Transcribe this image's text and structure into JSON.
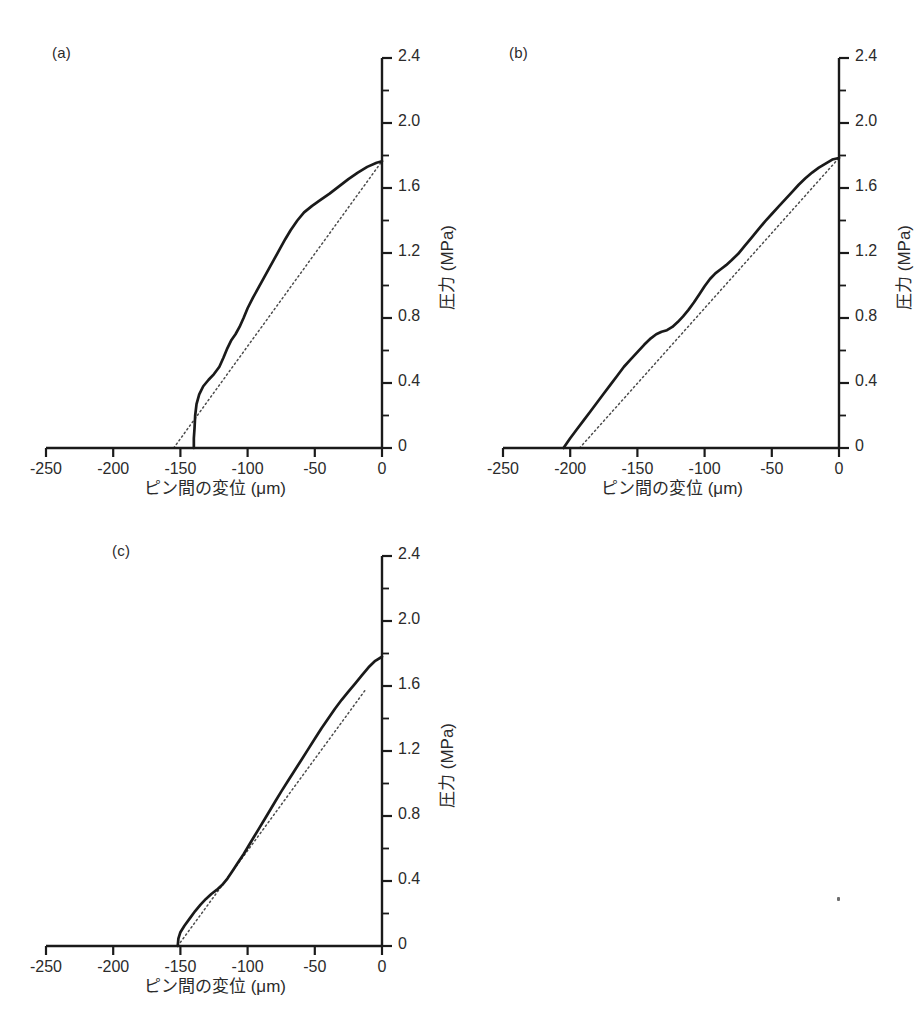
{
  "figure": {
    "background": "#ffffff",
    "ink_color": "#1a1a1a",
    "panels": [
      {
        "label": "(a)",
        "xlabel": "ピン間の変位 (μm)",
        "ylabel": "圧力 (MPa)"
      },
      {
        "label": "(b)",
        "xlabel": "ピン間の変位 (μm)",
        "ylabel": "圧力 (MPa)"
      },
      {
        "label": "(c)",
        "xlabel": "ピン間の変位 (μm)",
        "ylabel": "圧力 (MPa)"
      }
    ]
  },
  "chart_data": [
    {
      "type": "line",
      "panel": "(a)",
      "title": "",
      "xlabel": "ピン間の変位 (μm)",
      "ylabel": "圧力 (MPa)",
      "xlim": [
        -250,
        0
      ],
      "ylim": [
        0,
        2.4
      ],
      "xticks": [
        -250,
        -200,
        -150,
        -100,
        -50,
        0
      ],
      "xtick_labels": [
        "-250",
        "-200",
        "-150",
        "-100",
        "-50",
        "0"
      ],
      "yticks": [
        0,
        0.4,
        0.8,
        1.2,
        1.6,
        2.0,
        2.4
      ],
      "ytick_labels": [
        "0",
        "0.4",
        "0.8",
        "1.2",
        "1.6",
        "2.0",
        "2.4"
      ],
      "minor_yticks": [
        0.2,
        0.6,
        1.0,
        1.4,
        1.8,
        2.2
      ],
      "grid": false,
      "legend": "none",
      "series": [
        {
          "name": "measured",
          "style": "solid",
          "points": [
            [
              -140,
              0.0
            ],
            [
              -140,
              0.06
            ],
            [
              -139.5,
              0.12
            ],
            [
              -139,
              0.2
            ],
            [
              -138,
              0.27
            ],
            [
              -136,
              0.33
            ],
            [
              -133,
              0.38
            ],
            [
              -129,
              0.42
            ],
            [
              -125,
              0.455
            ],
            [
              -121,
              0.5
            ],
            [
              -118,
              0.555
            ],
            [
              -115,
              0.615
            ],
            [
              -112,
              0.665
            ],
            [
              -109,
              0.7
            ],
            [
              -106,
              0.745
            ],
            [
              -103,
              0.8
            ],
            [
              -100,
              0.86
            ],
            [
              -96,
              0.925
            ],
            [
              -92,
              0.985
            ],
            [
              -88,
              1.045
            ],
            [
              -84,
              1.105
            ],
            [
              -80,
              1.165
            ],
            [
              -76,
              1.225
            ],
            [
              -72,
              1.285
            ],
            [
              -68,
              1.34
            ],
            [
              -63,
              1.4
            ],
            [
              -58,
              1.45
            ],
            [
              -52,
              1.49
            ],
            [
              -46,
              1.525
            ],
            [
              -39,
              1.565
            ],
            [
              -32,
              1.61
            ],
            [
              -25,
              1.655
            ],
            [
              -18,
              1.695
            ],
            [
              -11,
              1.73
            ],
            [
              -4,
              1.755
            ],
            [
              0,
              1.765
            ]
          ]
        },
        {
          "name": "linear-fit",
          "style": "dotted",
          "points": [
            [
              -155,
              0.0
            ],
            [
              0,
              1.765
            ]
          ]
        }
      ]
    },
    {
      "type": "line",
      "panel": "(b)",
      "title": "",
      "xlabel": "ピン間の変位 (μm)",
      "ylabel": "圧力 (MPa)",
      "xlim": [
        -250,
        0
      ],
      "ylim": [
        0,
        2.4
      ],
      "xticks": [
        -250,
        -200,
        -150,
        -100,
        -50,
        0
      ],
      "xtick_labels": [
        "-250",
        "-200",
        "-150",
        "-100",
        "-50",
        "0"
      ],
      "yticks": [
        0,
        0.4,
        0.8,
        1.2,
        1.6,
        2.0,
        2.4
      ],
      "ytick_labels": [
        "0",
        "0.4",
        "0.8",
        "1.2",
        "1.6",
        "2.0",
        "2.4"
      ],
      "minor_yticks": [
        0.2,
        0.6,
        1.0,
        1.4,
        1.8,
        2.2
      ],
      "grid": false,
      "legend": "none",
      "series": [
        {
          "name": "measured",
          "style": "solid",
          "points": [
            [
              -205,
              0.0
            ],
            [
              -200,
              0.06
            ],
            [
              -195,
              0.115
            ],
            [
              -190,
              0.17
            ],
            [
              -185,
              0.225
            ],
            [
              -180,
              0.28
            ],
            [
              -175,
              0.335
            ],
            [
              -170,
              0.39
            ],
            [
              -165,
              0.445
            ],
            [
              -160,
              0.5
            ],
            [
              -155,
              0.545
            ],
            [
              -150,
              0.59
            ],
            [
              -145,
              0.635
            ],
            [
              -140,
              0.675
            ],
            [
              -136,
              0.7
            ],
            [
              -132,
              0.715
            ],
            [
              -128,
              0.725
            ],
            [
              -124,
              0.745
            ],
            [
              -120,
              0.775
            ],
            [
              -116,
              0.81
            ],
            [
              -112,
              0.85
            ],
            [
              -108,
              0.895
            ],
            [
              -104,
              0.945
            ],
            [
              -100,
              0.995
            ],
            [
              -96,
              1.04
            ],
            [
              -92,
              1.075
            ],
            [
              -88,
              1.1
            ],
            [
              -84,
              1.125
            ],
            [
              -80,
              1.155
            ],
            [
              -75,
              1.195
            ],
            [
              -70,
              1.245
            ],
            [
              -65,
              1.295
            ],
            [
              -60,
              1.345
            ],
            [
              -55,
              1.395
            ],
            [
              -50,
              1.44
            ],
            [
              -45,
              1.485
            ],
            [
              -40,
              1.53
            ],
            [
              -35,
              1.575
            ],
            [
              -30,
              1.62
            ],
            [
              -25,
              1.66
            ],
            [
              -20,
              1.695
            ],
            [
              -15,
              1.725
            ],
            [
              -10,
              1.75
            ],
            [
              -5,
              1.775
            ],
            [
              0,
              1.785
            ]
          ]
        },
        {
          "name": "linear-fit",
          "style": "dotted",
          "points": [
            [
              -193,
              0.0
            ],
            [
              0,
              1.785
            ]
          ]
        }
      ]
    },
    {
      "type": "line",
      "panel": "(c)",
      "title": "",
      "xlabel": "ピン間の変位 (μm)",
      "ylabel": "圧力 (MPa)",
      "xlim": [
        -250,
        0
      ],
      "ylim": [
        0,
        2.4
      ],
      "xticks": [
        -250,
        -200,
        -150,
        -100,
        -50,
        0
      ],
      "xtick_labels": [
        "-250",
        "-200",
        "-150",
        "-100",
        "-50",
        "0"
      ],
      "yticks": [
        0,
        0.4,
        0.8,
        1.2,
        1.6,
        2.0,
        2.4
      ],
      "ytick_labels": [
        "0",
        "0.4",
        "0.8",
        "1.2",
        "1.6",
        "2.0",
        "2.4"
      ],
      "minor_yticks": [
        0.2,
        0.6,
        1.0,
        1.4,
        1.8,
        2.2
      ],
      "grid": false,
      "legend": "none",
      "series": [
        {
          "name": "measured",
          "style": "solid",
          "points": [
            [
              -152,
              0.0
            ],
            [
              -151.5,
              0.045
            ],
            [
              -150,
              0.085
            ],
            [
              -147,
              0.125
            ],
            [
              -143,
              0.17
            ],
            [
              -139,
              0.215
            ],
            [
              -135,
              0.255
            ],
            [
              -131,
              0.29
            ],
            [
              -127,
              0.32
            ],
            [
              -123,
              0.345
            ],
            [
              -119,
              0.375
            ],
            [
              -115,
              0.415
            ],
            [
              -111,
              0.465
            ],
            [
              -107,
              0.515
            ],
            [
              -103,
              0.565
            ],
            [
              -99,
              0.62
            ],
            [
              -95,
              0.675
            ],
            [
              -91,
              0.73
            ],
            [
              -87,
              0.785
            ],
            [
              -83,
              0.84
            ],
            [
              -79,
              0.895
            ],
            [
              -75,
              0.95
            ],
            [
              -70,
              1.015
            ],
            [
              -65,
              1.08
            ],
            [
              -60,
              1.145
            ],
            [
              -55,
              1.21
            ],
            [
              -50,
              1.275
            ],
            [
              -45,
              1.34
            ],
            [
              -40,
              1.4
            ],
            [
              -35,
              1.46
            ],
            [
              -30,
              1.515
            ],
            [
              -25,
              1.565
            ],
            [
              -20,
              1.615
            ],
            [
              -15,
              1.665
            ],
            [
              -10,
              1.715
            ],
            [
              -5,
              1.755
            ],
            [
              0,
              1.78
            ]
          ]
        },
        {
          "name": "linear-fit",
          "style": "dotted",
          "points": [
            [
              -152,
              0.0
            ],
            [
              -12,
              1.58
            ]
          ]
        }
      ]
    }
  ]
}
